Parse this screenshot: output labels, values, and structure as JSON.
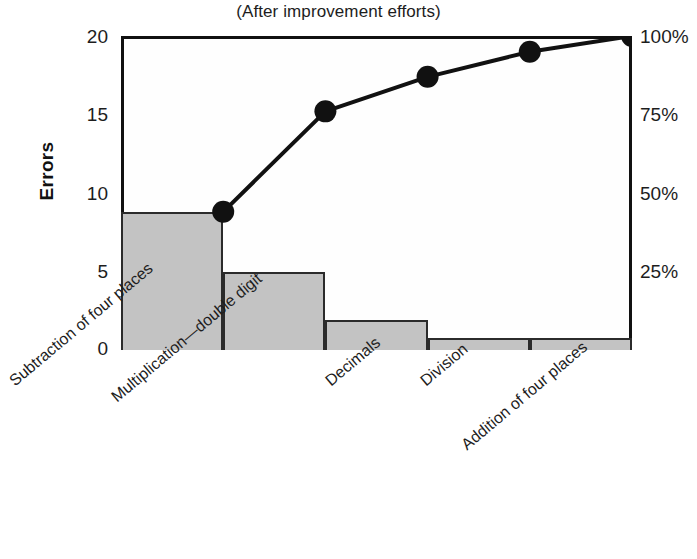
{
  "chart_data": {
    "type": "bar",
    "title": "(After improvement efforts)",
    "xlabel": "",
    "ylabel": "Errors",
    "ylim": [
      0,
      20
    ],
    "y2lim": [
      0,
      100
    ],
    "grid": false,
    "legend": "none",
    "categories": [
      "Subtraction of four places",
      "Multiplication—double digit",
      "Decimals",
      "Division",
      "Addition of four places"
    ],
    "series": [
      {
        "name": "Errors",
        "type": "bar",
        "values": [
          8.8,
          5.0,
          1.9,
          0.75,
          0.75
        ]
      },
      {
        "name": "Cumulative percent",
        "type": "line",
        "axis": "right",
        "values": [
          44,
          76,
          87,
          95,
          100
        ]
      }
    ],
    "yticks": [
      0,
      5,
      10,
      15,
      20
    ],
    "ytick_labels": [
      "0",
      "5",
      "10",
      "15",
      "20"
    ],
    "y2ticks": [
      25,
      50,
      75,
      100
    ],
    "y2tick_labels": [
      "25%",
      "50%",
      "75%",
      "100%"
    ],
    "colors": {
      "bar_fill": "#c3c3c3",
      "bar_edge": "#2b2b2b",
      "line": "#111111",
      "marker": "#111111",
      "axis": "#111111",
      "plot_background": "#fefefe"
    }
  },
  "axes": {
    "left_title": "Errors",
    "tick_0": "0",
    "tick_5": "5",
    "tick_10": "10",
    "tick_15": "15",
    "tick_20": "20",
    "right_tick_25": "25%",
    "right_tick_50": "50%",
    "right_tick_75": "75%",
    "right_tick_100": "100%"
  },
  "header": {
    "title": "(After improvement efforts)"
  },
  "xlabels": {
    "c0": "Subtraction of four places",
    "c1": "Multiplication—double digit",
    "c2": "Decimals",
    "c3": "Division",
    "c4": "Addition of four places"
  }
}
